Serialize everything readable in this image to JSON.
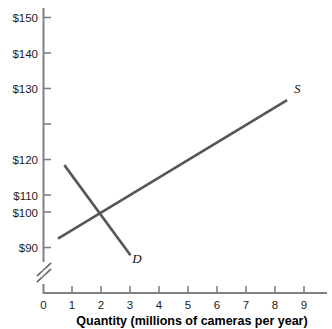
{
  "chart_data": {
    "type": "line",
    "title": "",
    "xlabel": "Quantity (millions of cameras per year)",
    "ylabel": "",
    "xlim": [
      0,
      9.8
    ],
    "ylim": [
      88,
      153
    ],
    "grid": false,
    "legend_position": "inline-curve-labels",
    "y_axis_break": true,
    "y_axis_break_symbol": "//",
    "x_ticks": [
      "0",
      "1",
      "2",
      "3",
      "4",
      "5",
      "6",
      "7",
      "8",
      "9"
    ],
    "x_tick_values": [
      0,
      1,
      2,
      3,
      4,
      5,
      6,
      7,
      8,
      9
    ],
    "y_ticks": [
      "$90",
      "$100",
      "$110",
      "$120",
      "$130",
      "$140",
      "$150"
    ],
    "y_tick_values": [
      90,
      100,
      110,
      120,
      130,
      140,
      150
    ],
    "series": [
      {
        "name": "S",
        "label": "S",
        "description": "Supply curve, upward sloping",
        "color": "#55555a",
        "points": [
          {
            "x": 0.5,
            "y": 92.5
          },
          {
            "x": 8.4,
            "y": 131.5
          }
        ],
        "label_point": {
          "x": 8.75,
          "y": 133.5
        }
      },
      {
        "name": "D",
        "label": "D",
        "description": "Demand curve, downward sloping",
        "color": "#55555a",
        "points": [
          {
            "x": 0.72,
            "y": 113.2
          },
          {
            "x": 3.0,
            "y": 87.8
          }
        ],
        "label_point": {
          "x": 3.22,
          "y": 85.6
        }
      }
    ],
    "equilibrium": {
      "x": 2,
      "y": 100
    },
    "colors": {
      "curve": "#55555a",
      "axis": "#808086",
      "text": "#1b1b1b"
    }
  }
}
